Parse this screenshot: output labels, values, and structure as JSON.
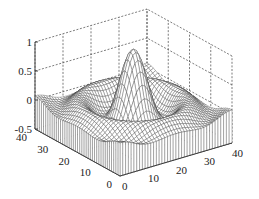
{
  "chart_data": {
    "type": "surface",
    "subtype": "meshz",
    "title": "",
    "function": "sinc-like ripple: z = sin(r)/r over 40x40 grid centered at (20,20)",
    "xlabel": "",
    "ylabel": "",
    "zlabel": "",
    "x_ticks": [
      "0",
      "10",
      "20",
      "30",
      "40"
    ],
    "y_ticks": [
      "0",
      "10",
      "20",
      "30",
      "40"
    ],
    "z_ticks": [
      "-0.5",
      "0",
      "0.5",
      "1"
    ],
    "xlim": [
      0,
      40
    ],
    "ylim": [
      0,
      40
    ],
    "zlim": [
      -0.5,
      1
    ],
    "grid": true,
    "grid_style": "dashed",
    "peak": {
      "x": 20,
      "y": 20,
      "z": 1
    },
    "grid_size": [
      40,
      40
    ],
    "line_color": "#333333",
    "face_color": "#ffffff"
  },
  "projection": {
    "origin_px": [
      120,
      176
    ],
    "x_end_px": [
      232,
      143
    ],
    "y_end_px": [
      35,
      129
    ],
    "z_px_per_unit": 58
  }
}
